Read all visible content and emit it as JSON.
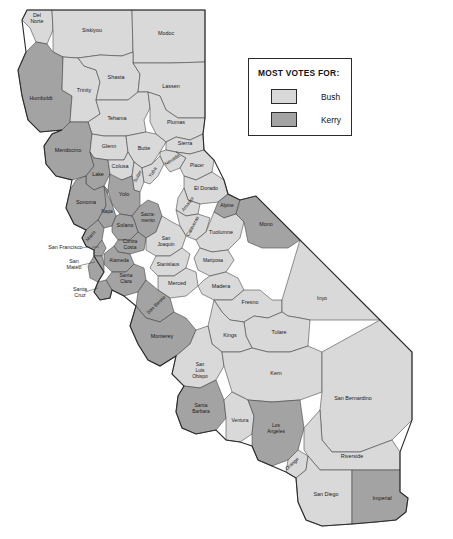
{
  "legend": {
    "title": "MOST VOTES FOR:",
    "entries": [
      {
        "label": "Bush",
        "color": "#d9d9d9"
      },
      {
        "label": "Kerry",
        "color": "#a3a3a3"
      }
    ]
  },
  "colors": {
    "bush": "#d9d9d9",
    "kerry": "#a3a3a3",
    "border": "#3a3a3a",
    "state_border": "#2b2b2b",
    "background": "#ffffff"
  },
  "map_data": {
    "type": "choropleth",
    "title": "California counties by 2004 presidential vote winner",
    "region": "California",
    "categories": [
      "Bush",
      "Kerry"
    ],
    "counties": [
      {
        "name": "Del Norte",
        "winner": "Bush"
      },
      {
        "name": "Siskiyou",
        "winner": "Bush"
      },
      {
        "name": "Modoc",
        "winner": "Bush"
      },
      {
        "name": "Humboldt",
        "winner": "Kerry"
      },
      {
        "name": "Trinity",
        "winner": "Bush"
      },
      {
        "name": "Shasta",
        "winner": "Bush"
      },
      {
        "name": "Lassen",
        "winner": "Bush"
      },
      {
        "name": "Tehama",
        "winner": "Bush"
      },
      {
        "name": "Plumas",
        "winner": "Bush"
      },
      {
        "name": "Mendocino",
        "winner": "Kerry"
      },
      {
        "name": "Glenn",
        "winner": "Bush"
      },
      {
        "name": "Butte",
        "winner": "Bush"
      },
      {
        "name": "Sierra",
        "winner": "Bush"
      },
      {
        "name": "Lake",
        "winner": "Kerry"
      },
      {
        "name": "Colusa",
        "winner": "Bush"
      },
      {
        "name": "Sutter",
        "winner": "Bush"
      },
      {
        "name": "Yuba",
        "winner": "Bush"
      },
      {
        "name": "Nevada",
        "winner": "Bush"
      },
      {
        "name": "Placer",
        "winner": "Bush"
      },
      {
        "name": "Yolo",
        "winner": "Kerry"
      },
      {
        "name": "El Dorado",
        "winner": "Bush"
      },
      {
        "name": "Sonoma",
        "winner": "Kerry"
      },
      {
        "name": "Napa",
        "winner": "Kerry"
      },
      {
        "name": "Sacramento",
        "winner": "Kerry"
      },
      {
        "name": "Amador",
        "winner": "Bush"
      },
      {
        "name": "Alpine",
        "winner": "Kerry"
      },
      {
        "name": "Solano",
        "winner": "Kerry"
      },
      {
        "name": "Calaveras",
        "winner": "Bush"
      },
      {
        "name": "Marin",
        "winner": "Kerry"
      },
      {
        "name": "Contra Costa",
        "winner": "Kerry"
      },
      {
        "name": "San Joaquin",
        "winner": "Bush"
      },
      {
        "name": "Tuolumne",
        "winner": "Bush"
      },
      {
        "name": "Mono",
        "winner": "Kerry"
      },
      {
        "name": "San Francisco",
        "winner": "Kerry"
      },
      {
        "name": "Alameda",
        "winner": "Kerry"
      },
      {
        "name": "Stanislaus",
        "winner": "Bush"
      },
      {
        "name": "Mariposa",
        "winner": "Bush"
      },
      {
        "name": "San Mateo",
        "winner": "Kerry"
      },
      {
        "name": "Santa Clara",
        "winner": "Kerry"
      },
      {
        "name": "Merced",
        "winner": "Bush"
      },
      {
        "name": "Madera",
        "winner": "Bush"
      },
      {
        "name": "Santa Cruz",
        "winner": "Kerry"
      },
      {
        "name": "San Benito",
        "winner": "Kerry"
      },
      {
        "name": "Fresno",
        "winner": "Bush"
      },
      {
        "name": "Inyo",
        "winner": "Bush"
      },
      {
        "name": "Monterey",
        "winner": "Kerry"
      },
      {
        "name": "Tulare",
        "winner": "Bush"
      },
      {
        "name": "Kings",
        "winner": "Bush"
      },
      {
        "name": "San Luis Obispo",
        "winner": "Bush"
      },
      {
        "name": "Kern",
        "winner": "Bush"
      },
      {
        "name": "San Bernardino",
        "winner": "Bush"
      },
      {
        "name": "Santa Barbara",
        "winner": "Kerry"
      },
      {
        "name": "Ventura",
        "winner": "Bush"
      },
      {
        "name": "Los Angeles",
        "winner": "Kerry"
      },
      {
        "name": "Orange",
        "winner": "Bush"
      },
      {
        "name": "Riverside",
        "winner": "Bush"
      },
      {
        "name": "San Diego",
        "winner": "Bush"
      },
      {
        "name": "Imperial",
        "winner": "Kerry"
      }
    ],
    "counts": {
      "Bush": 44,
      "Kerry": 14
    },
    "leader_labels": [
      "San Francisco",
      "San Mateo",
      "Santa Cruz"
    ]
  }
}
